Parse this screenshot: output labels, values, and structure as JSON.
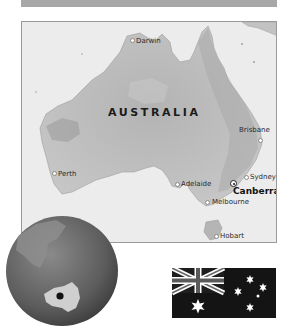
{
  "header": {
    "bar_color": "#a7a7a7"
  },
  "map": {
    "country_label": "AUSTRALIA",
    "cities": [
      {
        "name": "Darwin",
        "dot_x": 131,
        "dot_y": 39
      },
      {
        "name": "Brisbane",
        "dot_x": 259,
        "dot_y": 139
      },
      {
        "name": "Perth",
        "dot_x": 53,
        "dot_y": 172
      },
      {
        "name": "Sydney",
        "dot_x": 245,
        "dot_y": 176
      },
      {
        "name": "Adelaide",
        "dot_x": 176,
        "dot_y": 183
      },
      {
        "name": "Melbourne",
        "dot_x": 206,
        "dot_y": 201
      },
      {
        "name": "Hobart",
        "dot_x": 215,
        "dot_y": 235
      }
    ],
    "capital": {
      "name": "Canberra",
      "dot_x": 232,
      "dot_y": 182
    },
    "colors": {
      "sea": "#ececec",
      "land": "#bcbcbc",
      "land_dark": "#a8a8a8"
    }
  },
  "globe": {
    "icon": "globe-locator-icon",
    "marker": "location-marker"
  },
  "flag": {
    "icon": "australian-flag-icon",
    "background": "#141414",
    "stars": 6
  }
}
